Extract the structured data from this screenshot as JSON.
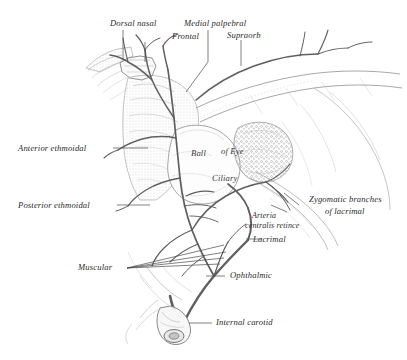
{
  "figure": {
    "ink_color": "#6f6f6f",
    "ink_dark": "#4a4a4a",
    "label_color": "#2b2b2b",
    "background": "#ffffff"
  },
  "labels": {
    "dorsal_nasal": "Dorsal nasal",
    "frontal": "Frontal",
    "medial_palpebral": "Medial palpebral",
    "supraorbital": "Supraorb",
    "anterior_ethmoidal": "Anterior ethmoidal",
    "posterior_ethmoidal": "Posterior ethmoidal",
    "ball_of_eye_1": "Ball",
    "ball_of_eye_2": "of Eye",
    "ciliary": "Ciliary",
    "zygomatic_line_1": "Zygomatic branches",
    "zygomatic_line_2": "of lacrimal",
    "arteria_line_1": "Arteria",
    "arteria_line_2": "centralis retince",
    "lacrimal": "Lacrimal",
    "muscular": "Muscular",
    "ophthalmic": "Ophthalmic",
    "internal_carotid": "Internal carotid"
  }
}
